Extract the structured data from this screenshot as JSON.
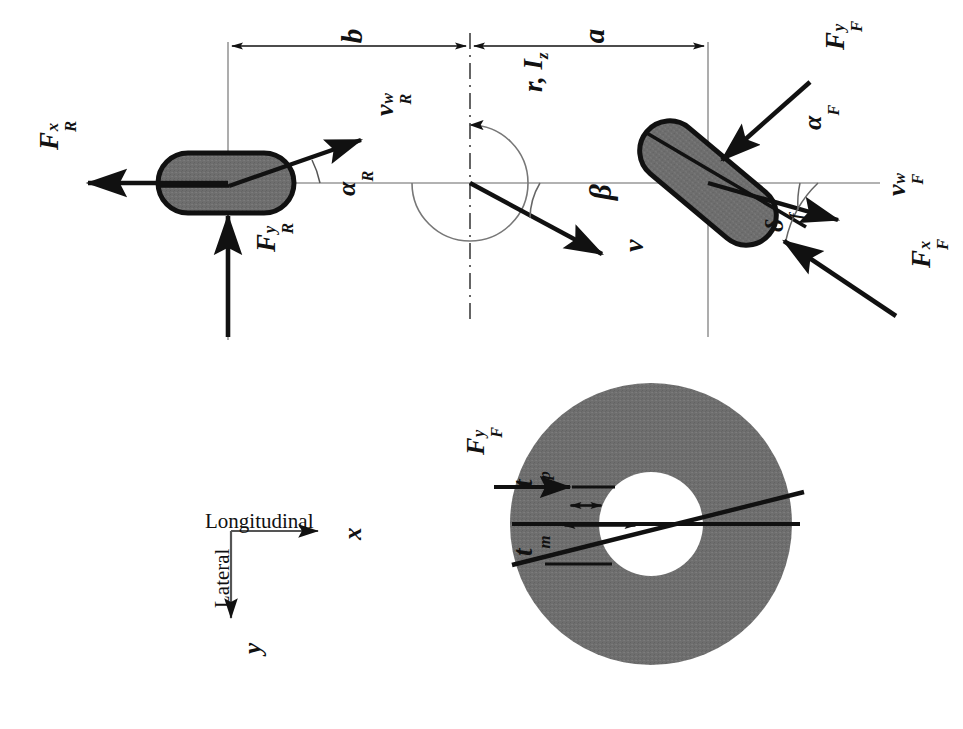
{
  "figure": {
    "background_color": "#ffffff",
    "ink_color": "#111111",
    "tire_fill_color": "#6e6e6e",
    "axis_line_color": "#8a8a8a",
    "width": 963,
    "height": 729
  },
  "top_diagram": {
    "name": "bicycle-model",
    "dimensions": [
      {
        "key": "b",
        "label": "b",
        "desc": "distance from CG to rear axle"
      },
      {
        "key": "a",
        "label": "a",
        "desc": "distance from CG to front axle"
      }
    ],
    "cg": {
      "label": "r, I",
      "label_main": "r, I",
      "label_sub": "z",
      "desc": "yaw rate and yaw moment of inertia at center of gravity"
    },
    "rear": {
      "force_x": {
        "base": "F",
        "sup": "x",
        "sub": "R"
      },
      "force_y": {
        "base": "F",
        "sup": "y",
        "sub": "R"
      },
      "velocity": {
        "base": "v",
        "sup": "w",
        "sub": "R"
      },
      "slip_angle": {
        "base": "α",
        "sub": "R"
      }
    },
    "front": {
      "force_x": {
        "base": "F",
        "sup": "x",
        "sub": "F"
      },
      "force_y": {
        "base": "F",
        "sup": "y",
        "sub": "F"
      },
      "velocity": {
        "base": "v",
        "sup": "w",
        "sub": "F"
      },
      "slip_angle": {
        "base": "α",
        "sub": "F"
      },
      "steer_angle": {
        "base": "δ",
        "sub": "f"
      }
    },
    "body": {
      "sideslip_angle": {
        "base": "β"
      },
      "velocity": {
        "base": "v"
      }
    }
  },
  "axes_legend": {
    "name": "coordinate-legend",
    "longitudinal_label": "Longitudinal",
    "lateral_label": "Lateral",
    "x_axis_label": "x",
    "y_axis_label": "y"
  },
  "tire_detail": {
    "name": "tire-pneumatic-trail-detail",
    "force_label": {
      "base": "F",
      "sup": "y",
      "sub": "F"
    },
    "pneumatic_trail": {
      "base": "t",
      "sub": "p"
    },
    "mechanical_trail": {
      "base": "t",
      "sub": "m"
    },
    "tire_outer_fill": "#6e6e6e",
    "tire_hub_fill": "#ffffff"
  }
}
